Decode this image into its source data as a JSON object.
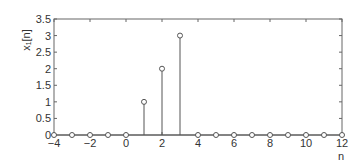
{
  "chart_data": {
    "type": "stem",
    "title": "",
    "xlabel": "n",
    "ylabel": "x₁[n]",
    "xlim": [
      -4,
      12
    ],
    "ylim": [
      0,
      3.5
    ],
    "xticks": [
      -4,
      -2,
      0,
      2,
      4,
      6,
      8,
      10,
      12
    ],
    "xtick_labels": [
      "−4",
      "−2",
      "0",
      "2",
      "4",
      "6",
      "8",
      "10",
      "12"
    ],
    "yticks": [
      0,
      0.5,
      1,
      1.5,
      2,
      2.5,
      3,
      3.5
    ],
    "ytick_labels": [
      "0",
      "0.5",
      "1",
      "1.5",
      "2",
      "2.5",
      "3",
      "3.5"
    ],
    "grid": false,
    "x": [
      -4,
      -3,
      -2,
      -1,
      0,
      1,
      2,
      3,
      4,
      5,
      6,
      7,
      8,
      9,
      10,
      11,
      12
    ],
    "values": [
      0,
      0,
      0,
      0,
      0,
      1,
      2,
      3,
      0,
      0,
      0,
      0,
      0,
      0,
      0,
      0,
      0
    ],
    "marker": "open-circle",
    "color": "#555555"
  }
}
